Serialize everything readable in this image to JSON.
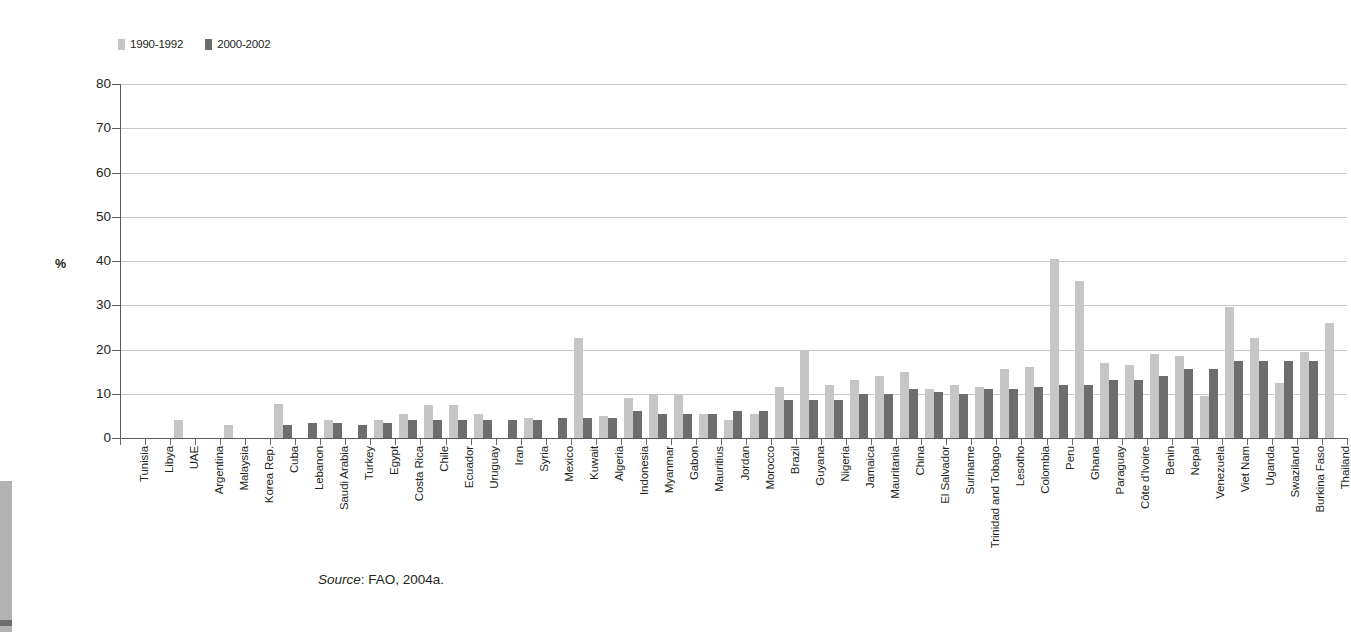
{
  "legend": {
    "items": [
      {
        "label": "1990-1992",
        "color": "#c6c6c6"
      },
      {
        "label": "2000-2002",
        "color": "#6d6d6d"
      }
    ]
  },
  "axis": {
    "y_title": "%",
    "y_ticks": [
      "0",
      "10",
      "20",
      "30",
      "40",
      "50",
      "60",
      "70",
      "80"
    ]
  },
  "source": {
    "prefix": "Source",
    "text": ": FAO, 2004a."
  },
  "chart_data": {
    "type": "bar",
    "title": "",
    "xlabel": "",
    "ylabel": "%",
    "ylim": [
      0,
      80
    ],
    "ytick_step": 10,
    "grid": true,
    "legend_position": "top-left",
    "categories": [
      "Tunisia",
      "Libya",
      "UAE",
      "Argentina",
      "Malaysia",
      "Korea Rep.",
      "Cuba",
      "Lebanon",
      "Saudi Arabia",
      "Turkey",
      "Egypt",
      "Costa Rica",
      "Chile",
      "Ecuador",
      "Uruguay",
      "Iran",
      "Syria",
      "Mexico",
      "Kuwait",
      "Algeria",
      "Indonesia",
      "Myanmar",
      "Gabon",
      "Mauritius",
      "Jordan",
      "Morocco",
      "Brazil",
      "Guyana",
      "Nigeria",
      "Jamaica",
      "Mauritania",
      "China",
      "El Salvador",
      "Suriname",
      "Trinidad and Tobago",
      "Lesotho",
      "Colombia",
      "Peru",
      "Ghana",
      "Paraguay",
      "Côte d'Ivoire",
      "Benin",
      "Nepal",
      "Venezuela",
      "Viet Nam",
      "Uganda",
      "Swaziland",
      "Burkina Faso",
      "Thailand"
    ],
    "series": [
      {
        "name": "1990-1992",
        "color": "#c6c6c6",
        "values": [
          0,
          0,
          4,
          0,
          3,
          0,
          7.8,
          0,
          4,
          0,
          4,
          5.5,
          7.5,
          7.5,
          5.5,
          0,
          4.5,
          0,
          22.5,
          5,
          9,
          10,
          10,
          5.5,
          4,
          5.5,
          11.5,
          20,
          12,
          13,
          14,
          15,
          11,
          12,
          11.5,
          15.5,
          16,
          40.5,
          35.5,
          17,
          16.5,
          19,
          18.5,
          9.5,
          29.5,
          22.5,
          12.5,
          19.5,
          26
        ]
      },
      {
        "name": "2000-2002",
        "color": "#6d6d6d",
        "values": [
          0,
          0,
          0,
          0,
          0,
          0,
          3,
          3.5,
          3.5,
          3,
          3.5,
          4,
          4,
          4,
          4,
          4,
          4,
          4.5,
          4.5,
          4.5,
          6,
          5.5,
          5.5,
          5.5,
          6,
          6,
          8.5,
          8.5,
          8.5,
          10,
          10,
          11,
          10.5,
          10,
          11,
          11,
          11.5,
          12,
          12,
          13,
          13,
          14,
          15.5,
          15.5,
          17.5,
          17.5,
          17.5,
          17.5,
          0
        ]
      }
    ]
  }
}
